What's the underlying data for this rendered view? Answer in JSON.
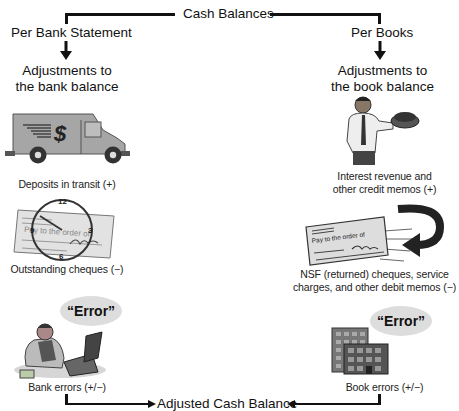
{
  "title": "Cash Balances",
  "left": {
    "heading": "Per Bank Statement",
    "subheading_line1": "Adjustments to",
    "subheading_line2": "the bank balance",
    "items": [
      {
        "caption": "Deposits in transit (+)",
        "icon": "armored-truck-icon"
      },
      {
        "caption": "Outstanding cheques (−)",
        "icon": "cheque-clock-icon",
        "cheque_text": "Pay to the order of",
        "clock_labels": [
          "12",
          "3",
          "6",
          "9"
        ]
      },
      {
        "caption": "Bank errors (+/−)",
        "icon": "banker-laptop-icon",
        "bubble": "“Error”"
      }
    ]
  },
  "right": {
    "heading": "Per Books",
    "subheading_line1": "Adjustments to",
    "subheading_line2": "the book balance",
    "items": [
      {
        "caption_line1": "Interest revenue and",
        "caption_line2": "other credit memos (+)",
        "icon": "man-holding-money-icon"
      },
      {
        "caption_line1": "NSF (returned) cheques, service",
        "caption_line2": "charges, and other debit memos (−)",
        "icon": "returned-cheque-icon",
        "cheque_text": "Pay to the order of"
      },
      {
        "caption": "Book errors (+/−)",
        "icon": "office-building-icon",
        "bubble": "“Error”"
      }
    ]
  },
  "footer": "Adjusted Cash Balance",
  "colors": {
    "line": "#111111",
    "illustration_gray": "#9a9a9a",
    "bubble": "#dddddd"
  }
}
